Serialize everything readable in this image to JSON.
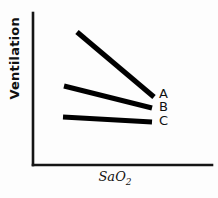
{
  "chart_data": {
    "type": "line",
    "title": "",
    "subtitle": "",
    "xlabel": "SaO2",
    "xlabel_main": "SaO",
    "xlabel_sub": "2",
    "ylabel": "Ventilation",
    "xlim": [
      0,
      100
    ],
    "ylim": [
      0,
      100
    ],
    "grid": false,
    "axis_ticks": false,
    "legend_position": "right-inline",
    "line_color": "#000000",
    "axis_color": "#151515",
    "background_color": "#fdfdfd",
    "series": [
      {
        "name": "A",
        "label": "A",
        "stroke_width": 5.2,
        "points": [
          {
            "x": 77,
            "y": 32
          },
          {
            "x": 154,
            "y": 97
          }
        ],
        "label_position": {
          "x": 159,
          "y": 87
        }
      },
      {
        "name": "B",
        "label": "B",
        "stroke_width": 5.0,
        "points": [
          {
            "x": 64,
            "y": 86
          },
          {
            "x": 152,
            "y": 108
          }
        ],
        "label_position": {
          "x": 159,
          "y": 100
        }
      },
      {
        "name": "C",
        "label": "C",
        "stroke_width": 4.8,
        "points": [
          {
            "x": 63,
            "y": 117
          },
          {
            "x": 152,
            "y": 122
          }
        ],
        "label_position": {
          "x": 159,
          "y": 114
        }
      }
    ],
    "axes": {
      "y_axis": {
        "x1": 33,
        "y1": 13,
        "x2": 33,
        "y2": 165
      },
      "x_axis": {
        "x1": 33,
        "y1": 165,
        "x2": 212,
        "y2": 165
      }
    }
  }
}
